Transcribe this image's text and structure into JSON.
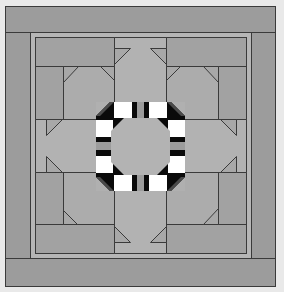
{
  "figure": {
    "title": ""
  },
  "colors": {
    "background": "#e9e9e9",
    "outer_border": "#9a9a9a",
    "inner_strip": "#b8b8b8",
    "frame_pieces": "#a0a0a0",
    "arm_light": "#b0b0b0",
    "corner_square": "#a9a9a9",
    "triangle": "#b4b4b4",
    "ring_white": "#ffffff",
    "ring_black": "#0a0a0a",
    "ring_dark_gray": "#4a4a4a",
    "ring_stripe_gray": "#9c9c9c",
    "center_octagon": "#b3b3b3",
    "line": "#3a3a3a"
  }
}
